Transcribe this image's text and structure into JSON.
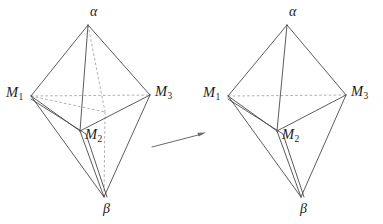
{
  "figure": {
    "canvas": {
      "width": 383,
      "height": 224,
      "background": "#ffffff"
    },
    "arrow": {
      "name": "transformation-arrow",
      "from": [
        152,
        147
      ],
      "to": [
        206,
        133
      ],
      "color": "#6a6a6a"
    },
    "colors": {
      "solid_edge": "#4a4a4a",
      "dashed_edge": "#9a9a9a",
      "label_text": "#1c1c1c",
      "arrow": "#6a6a6a",
      "background": "#ffffff"
    },
    "panels": [
      {
        "id": "left",
        "name": "left-polyhedron",
        "vertices": {
          "alpha": {
            "label": "α",
            "type": "greek",
            "x": 88,
            "y": 25,
            "label_x": 90,
            "label_y": 6
          },
          "m1": {
            "label": "M",
            "sub": "1",
            "type": "m",
            "x": 31,
            "y": 96,
            "label_x": 6,
            "label_y": 86
          },
          "m3": {
            "label": "M",
            "sub": "3",
            "type": "m",
            "x": 150,
            "y": 95,
            "label_x": 155,
            "label_y": 85
          },
          "m2": {
            "label": "M",
            "sub": "2",
            "type": "m",
            "x": 80,
            "y": 131,
            "label_x": 85,
            "label_y": 125
          },
          "beta": {
            "label": "β",
            "type": "greek",
            "x": 104,
            "y": 197,
            "label_x": 103,
            "label_y": 200
          },
          "mhidden": {
            "label": "",
            "type": "hidden",
            "x": 104,
            "y": 112
          }
        },
        "edges_solid": [
          [
            "alpha",
            "m1"
          ],
          [
            "alpha",
            "m3"
          ],
          [
            "alpha",
            "m2"
          ],
          [
            "m1",
            "m2"
          ],
          [
            "m3",
            "m2"
          ],
          [
            "m1",
            "beta"
          ],
          [
            "m3",
            "beta"
          ],
          [
            "m2",
            "beta"
          ],
          [
            "m1",
            "m2b"
          ],
          [
            "m2b",
            "beta"
          ]
        ],
        "edges_dashed": [
          [
            "m1",
            "m3"
          ],
          [
            "alpha",
            "mhidden"
          ],
          [
            "mhidden",
            "beta"
          ]
        ]
      },
      {
        "id": "right",
        "name": "right-polyhedron",
        "vertices": {
          "alpha": {
            "label": "α",
            "type": "greek",
            "x": 287,
            "y": 25,
            "label_x": 289,
            "label_y": 6
          },
          "m1": {
            "label": "M",
            "sub": "1",
            "type": "m",
            "x": 228,
            "y": 96,
            "label_x": 203,
            "label_y": 86
          },
          "m3": {
            "label": "M",
            "sub": "3",
            "type": "m",
            "x": 346,
            "y": 95,
            "label_x": 351,
            "label_y": 85
          },
          "m2": {
            "label": "M",
            "sub": "2",
            "type": "m",
            "x": 277,
            "y": 131,
            "label_x": 282,
            "label_y": 125
          },
          "beta": {
            "label": "β",
            "type": "greek",
            "x": 301,
            "y": 197,
            "label_x": 300,
            "label_y": 200
          }
        },
        "edges_solid": [
          [
            "alpha",
            "m1"
          ],
          [
            "alpha",
            "m3"
          ],
          [
            "alpha",
            "m2"
          ],
          [
            "m1",
            "m2"
          ],
          [
            "m3",
            "m2"
          ],
          [
            "m1",
            "beta"
          ],
          [
            "m3",
            "beta"
          ],
          [
            "m2",
            "beta"
          ]
        ],
        "edges_dashed": [
          [
            "m1",
            "m3"
          ]
        ]
      }
    ]
  }
}
